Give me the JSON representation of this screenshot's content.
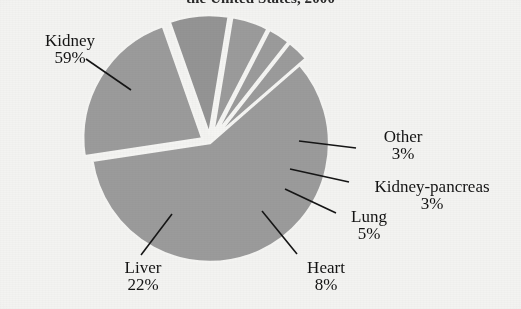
{
  "chart_data": {
    "type": "pie",
    "title": "the United States, 2000",
    "subtitle": "",
    "xlabel": "",
    "ylabel": "",
    "legend_position": "none",
    "grid": false,
    "units": "percent",
    "labels": [
      "Kidney",
      "Liver",
      "Heart",
      "Lung",
      "Kidney-pancreas",
      "Other"
    ],
    "values": [
      59,
      22,
      8,
      5,
      3,
      3
    ],
    "value_labels": [
      "59%",
      "22%",
      "8%",
      "5%",
      "3%",
      "3%"
    ],
    "slices": [
      {
        "name": "Kidney",
        "value": 59,
        "value_label": "59%",
        "color": "#9b9b9b",
        "exploded": false,
        "start_angle_deg": 41,
        "end_angle_deg": 253.4,
        "label_side": "left"
      },
      {
        "name": "Liver",
        "value": 22,
        "value_label": "22%",
        "color": "#9b9b9b",
        "exploded": true,
        "start_angle_deg": 253.4,
        "end_angle_deg": 332.6,
        "label_side": "bottom-left"
      },
      {
        "name": "Heart",
        "value": 8,
        "value_label": "8%",
        "color": "#949494",
        "exploded": true,
        "start_angle_deg": 332.6,
        "end_angle_deg": 361.4,
        "label_side": "bottom-right"
      },
      {
        "name": "Lung",
        "value": 5,
        "value_label": "5%",
        "color": "#9b9b9b",
        "exploded": true,
        "start_angle_deg": 361.4,
        "end_angle_deg": 379.4,
        "label_side": "right"
      },
      {
        "name": "Kidney-pancreas",
        "value": 3,
        "value_label": "3%",
        "color": "#9b9b9b",
        "exploded": true,
        "start_angle_deg": 379.4,
        "end_angle_deg": 390.2,
        "label_side": "right"
      },
      {
        "name": "Other",
        "value": 3,
        "value_label": "3%",
        "color": "#9b9b9b",
        "exploded": true,
        "start_angle_deg": 390.2,
        "end_angle_deg": 401,
        "label_side": "right"
      }
    ],
    "colors": {
      "slice_fill": "#9b9b9b",
      "slice_fill_dark": "#949494",
      "separator": "#f5f5f3",
      "leader_line": "#151515",
      "background": "#f3f3f1",
      "text": "#141414"
    },
    "geometry": {
      "center_x": 210,
      "center_y": 143,
      "radius": 119
    }
  },
  "labels": {
    "kidney": {
      "name": "Kidney",
      "pct": "59%"
    },
    "liver": {
      "name": "Liver",
      "pct": "22%"
    },
    "heart": {
      "name": "Heart",
      "pct": "8%"
    },
    "lung": {
      "name": "Lung",
      "pct": "5%"
    },
    "kidney_pancreas": {
      "name": "Kidney-pancreas",
      "pct": "3%"
    },
    "other": {
      "name": "Other",
      "pct": "3%"
    }
  },
  "title": {
    "text": "the United States, 2000"
  }
}
